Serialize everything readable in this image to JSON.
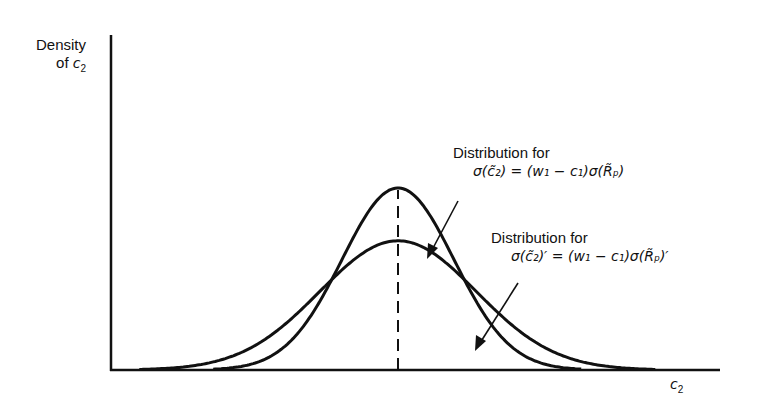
{
  "chart_data": {
    "type": "line",
    "title": "",
    "xlabel": "c2",
    "ylabel": "Density of c2",
    "grid": false,
    "legend_position": "none (inline annotations)",
    "axis_ticks": {
      "x": [],
      "y": []
    },
    "series": [
      {
        "name": "Distribution for σ(c̃2) = (w1 − c1)σ(R̃p)",
        "shape": "normal",
        "relative_std": 1.0,
        "relative_peak_height": 1.0,
        "center": "mean of c2 (dashed line)"
      },
      {
        "name": "Distribution for σ(c̃2)' = (w1 − c1)σ(R̃p)'",
        "shape": "normal",
        "relative_std": 1.4,
        "relative_peak_height": 0.71,
        "center": "mean of c2 (dashed line)"
      }
    ],
    "annotations": [
      {
        "text": "Distribution for",
        "equation": "σ(c̃2) = (w1 − c1)σ(R̃p)",
        "points_to": "narrow curve"
      },
      {
        "text": "Distribution for",
        "equation": "σ(c̃2)' = (w1 − c1)σ(R̃p)'",
        "points_to": "wide curve"
      }
    ],
    "reference_lines": [
      {
        "type": "vertical dashed",
        "at": "common mean"
      }
    ]
  },
  "labels": {
    "y_axis_line1": "Density",
    "y_axis_line2_prefix": "of ",
    "y_axis_var": "c",
    "y_axis_sub": "2",
    "x_axis_var": "c",
    "x_axis_sub": "2",
    "ann1_title": "Distribution for",
    "ann1_eq": "σ(c̃₂) = (w₁ − c₁)σ(R̃ₚ)",
    "ann2_title": "Distribution for",
    "ann2_eq": "σ(c̃₂)′ = (w₁ − c₁)σ(R̃ₚ)′"
  },
  "colors": {
    "ink": "#111111",
    "background": "#ffffff"
  }
}
